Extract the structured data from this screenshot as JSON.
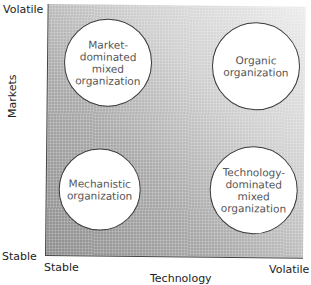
{
  "diagram": {
    "type": "2x2 matrix",
    "y_axis": {
      "title": "Markets",
      "low": "Stable",
      "high": "Volatile"
    },
    "x_axis": {
      "title": "Technology",
      "low": "Stable",
      "high": "Volatile"
    },
    "quadrants": {
      "top_left": "Market-\ndominated\nmixed\norganization",
      "top_right": "Organic\norganization",
      "bottom_left": "Mechanistic\norganization",
      "bottom_right": "Technology-\ndominated\nmixed\norganization"
    },
    "background": {
      "gradient_from": "#8e8e8e",
      "gradient_to": "#ececec",
      "direction": "bottom-left to top-right"
    }
  }
}
